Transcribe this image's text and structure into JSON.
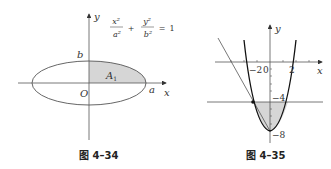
{
  "figure1": {
    "caption": "图 4–34",
    "axis_x_label": "x",
    "axis_y_label": "y",
    "origin_label": "O",
    "label_a": "a",
    "label_b": "b",
    "region_label": "A",
    "region_sub": "1",
    "equation": {
      "term1_num": "x²",
      "term1_den": "a²",
      "plus": "+",
      "term2_num": "y²",
      "term2_den": "b²",
      "equals": "=",
      "rhs": "1"
    },
    "colors": {
      "shade": "#d6d6d6",
      "line": "#555555"
    }
  },
  "figure2": {
    "caption": "图 4–35",
    "axis_x_label": "x",
    "axis_y_label": "y",
    "tick_neg2": "−2",
    "tick_0": "0",
    "tick_2": "2",
    "tick_neg4": "−4",
    "tick_neg8": "−8",
    "colors": {
      "shade": "#d6d6d6",
      "curve": "#111111",
      "line": "#555555"
    }
  }
}
